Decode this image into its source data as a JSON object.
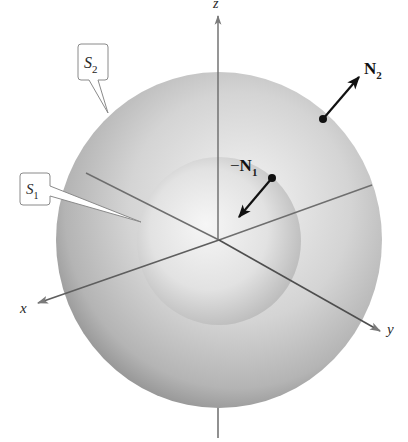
{
  "figure": {
    "colors": {
      "background": "#ffffff",
      "outer_sphere_light": "#f2f2f2",
      "outer_sphere_dark": "#8e8e8e",
      "inner_sphere_light": "#f4f4f4",
      "inner_sphere_dark": "#b0b0b0",
      "axis": "#6e6e6e",
      "vector": "#111111",
      "callout_border": "#8a8a8a"
    },
    "axes": {
      "x": {
        "label": "x"
      },
      "y": {
        "label": "y"
      },
      "z": {
        "label": "z"
      }
    },
    "surfaces": {
      "outer": {
        "name": "S",
        "subscript": "2"
      },
      "inner": {
        "name": "S",
        "subscript": "1"
      }
    },
    "vectors": {
      "outer_normal": {
        "prefix": "",
        "name": "N",
        "subscript": "2"
      },
      "inner_normal": {
        "prefix": "−",
        "name": "N",
        "subscript": "1"
      }
    }
  }
}
